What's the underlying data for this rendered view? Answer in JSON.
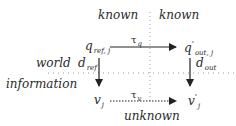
{
  "diagram": {
    "quadrant_labels": {
      "top_left": "known",
      "top_right": "known",
      "bottom": "unknown",
      "left_upper": "world",
      "left_lower": "information"
    },
    "nodes": {
      "q_ref": {
        "base": "q",
        "sub": "ref, j"
      },
      "q_out": {
        "base": "q",
        "sup": "'",
        "sub": "out, j"
      },
      "v": {
        "base": "v",
        "sub": "j"
      },
      "v_prime": {
        "base": "v",
        "sup": "'",
        "sub": "j"
      }
    },
    "edges": {
      "tau_q": {
        "base": "τ",
        "sub": "q",
        "from": "q_ref",
        "to": "q_out",
        "style": "solid"
      },
      "tau_v": {
        "base": "τ",
        "sub": "v",
        "from": "v",
        "to": "v_prime",
        "style": "dotted"
      },
      "d_ref": {
        "base": "d",
        "sub": "ref",
        "from": "q_ref",
        "to": "v",
        "style": "solid"
      },
      "d_out": {
        "base": "d",
        "sub": "out",
        "from": "q_out",
        "to": "v_prime",
        "style": "solid"
      }
    },
    "colors": {
      "ink": "#2a2a2a",
      "divider": "#9a9a9a"
    }
  }
}
